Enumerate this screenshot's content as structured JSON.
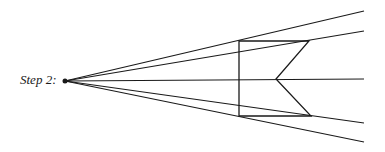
{
  "diagram": {
    "step_label": "Step 2:",
    "stroke_color": "#1a1a1a",
    "vanishing_point": {
      "x": 65,
      "y": 81
    },
    "rays": [
      {
        "x2": 364,
        "y2": 11
      },
      {
        "x2": 364,
        "y2": 31
      },
      {
        "x2": 364,
        "y2": 79
      },
      {
        "x2": 364,
        "y2": 123
      },
      {
        "x2": 364,
        "y2": 142
      }
    ],
    "shape_points": [
      [
        239,
        41
      ],
      [
        309,
        41
      ],
      [
        276,
        79
      ],
      [
        311,
        116
      ],
      [
        239,
        116
      ]
    ]
  }
}
